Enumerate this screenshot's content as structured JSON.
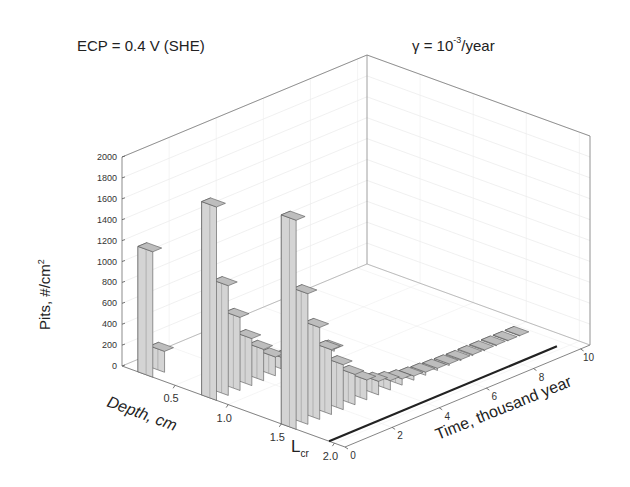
{
  "titles": {
    "left": "ECP = 0.4 V (SHE)",
    "right_prefix": "γ = 10",
    "right_exp": "-3",
    "right_suffix": "/year"
  },
  "chart_data": {
    "type": "bar3d",
    "xlabel": "Depth, cm",
    "ylabel": "Time, thousand year",
    "zlabel": "Pits, #/cm^2",
    "annotation": "L_cr",
    "x_ticks": [
      "0.5",
      "1.0",
      "1.5",
      "2.0"
    ],
    "y_ticks": [
      "0",
      "2",
      "4",
      "6",
      "8",
      "10"
    ],
    "z_ticks": [
      "0",
      "200",
      "400",
      "600",
      "800",
      "1000",
      "1200",
      "1400",
      "1600",
      "1800",
      "2000"
    ],
    "zlim": [
      0,
      2000
    ],
    "grid": true,
    "series": [
      {
        "name": "Depth 0.2 cm",
        "values": [
          1200,
          200
        ]
      },
      {
        "name": "Depth 0.6 cm",
        "values": [
          1850,
          1050,
          700,
          450,
          300,
          180,
          110,
          70,
          45,
          30,
          20
        ]
      },
      {
        "name": "Depth 1.0 cm",
        "values": [
          2000,
          1250,
          880,
          620,
          430,
          290,
          190,
          130,
          90,
          60,
          40,
          30,
          20,
          15,
          10,
          10,
          8,
          8,
          5,
          5
        ]
      }
    ],
    "critical_line": {
      "label": "L_cr",
      "depth": 2.0,
      "value": 0
    }
  },
  "axes": {
    "z_label": "Pits, #/cm",
    "z_label_exp": "2",
    "x_label": "Depth, cm",
    "y_label": "Time, thousand year",
    "lcr_main": "L",
    "lcr_sub": "cr"
  }
}
